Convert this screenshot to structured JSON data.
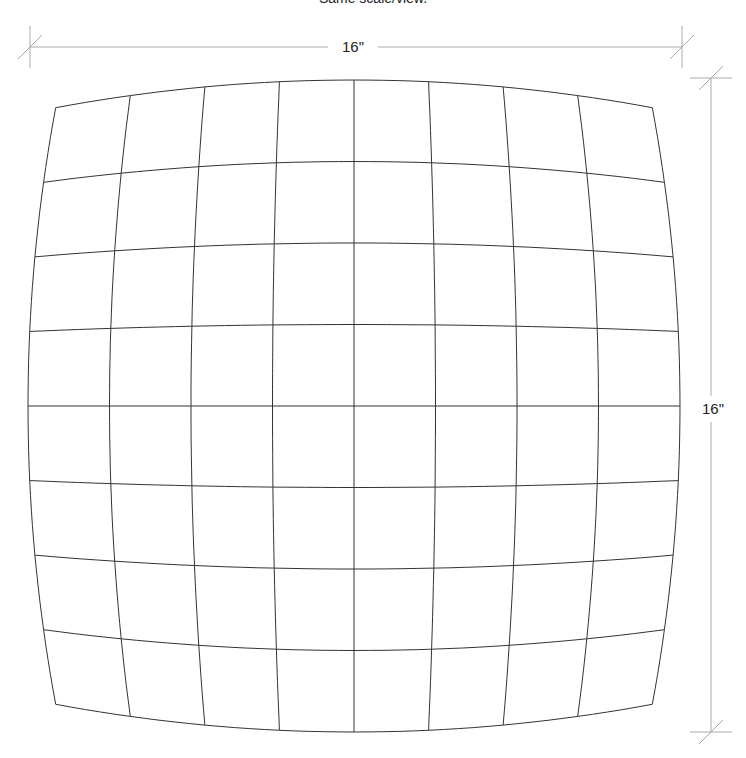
{
  "title": "Same scale/view.",
  "dimensions": {
    "width_label": "16\"",
    "height_label": "16\""
  },
  "grid": {
    "divisions": 8,
    "center_x": 354,
    "center_y": 406,
    "half_size": 326,
    "distortion_k": 0.085,
    "line_color": "#333333",
    "line_width": 1
  },
  "dimension_lines": {
    "color": "#aaaaaa",
    "horizontal": {
      "y": 47,
      "x1": 30,
      "x2": 682,
      "ext_top": 26,
      "ext_bottom": 68
    },
    "vertical": {
      "x": 711,
      "y1": 78,
      "y2": 732,
      "ext_left": 690,
      "ext_right": 732
    }
  },
  "colors": {
    "background": "#ffffff",
    "text": "#222222"
  }
}
